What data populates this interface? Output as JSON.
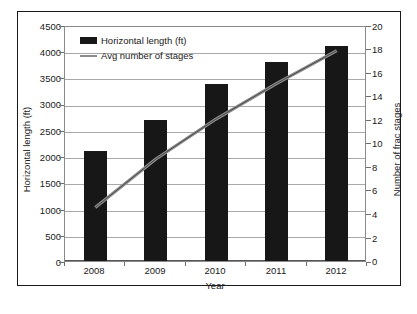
{
  "chart_data": {
    "type": "bar",
    "title": "",
    "categories": [
      "2008",
      "2009",
      "2010",
      "2011",
      "2012"
    ],
    "xlabel": "Year",
    "ylabel": "Horizontal length (ft)",
    "y2label": "Number of frac stages",
    "ylim": [
      0,
      4500
    ],
    "y2lim": [
      0,
      20
    ],
    "yticks": [
      "0",
      "500",
      "1000",
      "1500",
      "2000",
      "2500",
      "3000",
      "3500",
      "4000",
      "4500"
    ],
    "y2ticks": [
      "0",
      "2",
      "4",
      "6",
      "8",
      "10",
      "12",
      "14",
      "16",
      "18",
      "20"
    ],
    "grid": true,
    "legend_position": "upper-left-inside",
    "series": [
      {
        "name": "Horizontal length (ft)",
        "type": "bar",
        "axis": "left",
        "color": "#171717",
        "values": [
          2090,
          2680,
          3380,
          3790,
          4110
        ]
      },
      {
        "name": "Avg number of stages",
        "type": "line",
        "axis": "right",
        "color": "#8c8c8c",
        "values": [
          4.7,
          8.8,
          12.2,
          15.2,
          18.0
        ]
      }
    ]
  },
  "legend": {
    "items": [
      {
        "label": "Horizontal length (ft)",
        "marker": "bar-swatch"
      },
      {
        "label": "Avg number of stages",
        "marker": "line-swatch"
      }
    ]
  },
  "colors": {
    "bar": "#171717",
    "line": "#8c8c8c",
    "grid": "#a9a9a9",
    "frame": "#1a1a1a",
    "text": "#1a1a1a",
    "background": "#ffffff"
  }
}
